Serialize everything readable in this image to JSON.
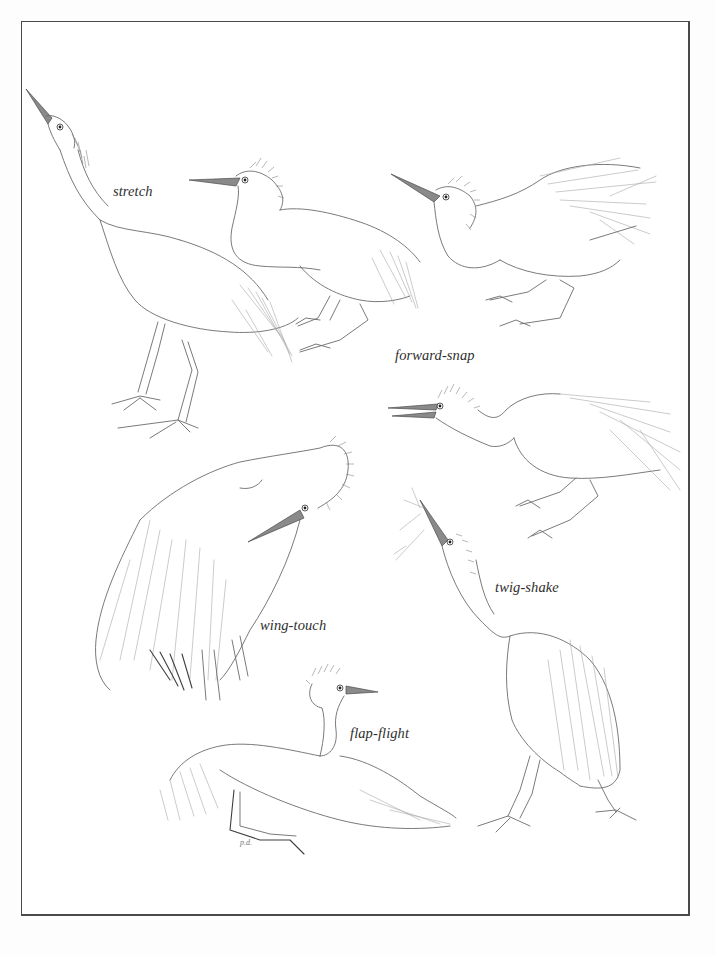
{
  "page": {
    "background": "#ffffff",
    "frame_color": "#4a4a4a",
    "ink_color": "#6b6b6b"
  },
  "labels": {
    "stretch": "stretch",
    "forward_snap": "forward-snap",
    "wing_touch": "wing-touch",
    "twig_shake": "twig-shake",
    "flap_flight": "flap-flight"
  },
  "figures": [
    {
      "id": "stretch",
      "label": "stretch",
      "pose": "neck stretched upward, bill pointing to sky"
    },
    {
      "id": "forward-snap-1",
      "label": "forward-snap",
      "pose": "crouched, bill forward, crest raised"
    },
    {
      "id": "forward-snap-2",
      "label": "forward-snap",
      "pose": "crouched, neck kinked, plumes raised"
    },
    {
      "id": "forward-snap-3",
      "label": "forward-snap",
      "pose": "lunging forward, bill open"
    },
    {
      "id": "wing-touch",
      "label": "wing-touch",
      "pose": "head tucked, bill touching wing"
    },
    {
      "id": "twig-shake",
      "label": "twig-shake",
      "pose": "bill up holding twig"
    },
    {
      "id": "flap-flight",
      "label": "flap-flight",
      "pose": "wings spread, legs dangling"
    }
  ],
  "signature": "p.d."
}
